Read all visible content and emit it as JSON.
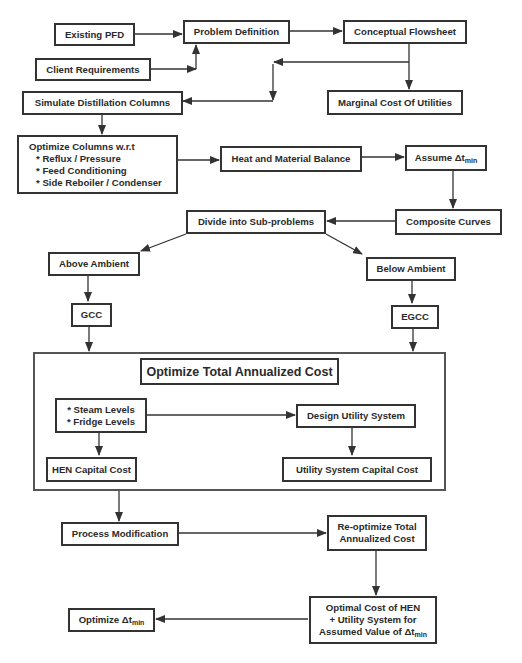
{
  "nodes": {
    "existing_pfd": "Existing PFD",
    "client_requirements": "Client Requirements",
    "problem_definition": "Problem Definition",
    "conceptual_flowsheet": "Conceptual Flowsheet",
    "simulate_distillation": "Simulate Distillation Columns",
    "marginal_cost": "Marginal Cost Of Utilities",
    "optimize_columns": {
      "title": "Optimize Columns w.r.t",
      "items": [
        "* Reflux / Pressure",
        "* Feed Conditioning",
        "* Side Reboiler / Condenser"
      ]
    },
    "heat_material_balance": "Heat and Material Balance",
    "assume_dt": {
      "prefix": "Assume ",
      "symbol": "Δt",
      "subscript": "min"
    },
    "divide_subproblems": "Divide into Sub-problems",
    "composite_curves": "Composite Curves",
    "above_ambient": "Above Ambient",
    "below_ambient": "Below Ambient",
    "gcc": "GCC",
    "egcc": "EGCC",
    "optimize_total": "Optimize Total Annualized Cost",
    "levels": [
      "* Steam Levels",
      "* Fridge Levels"
    ],
    "design_utility": "Design Utility System",
    "hen_capital": "HEN Capital Cost",
    "utility_capital": "Utility System Capital Cost",
    "process_modification": "Process Modification",
    "reoptimize": [
      "Re-optimize Total",
      "Annualized Cost"
    ],
    "optimal_cost": {
      "line1": "Optimal Cost of HEN",
      "line2": "+ Utility System for",
      "line3_prefix": "Assumed Value of ",
      "symbol": "Δt",
      "subscript": "min"
    },
    "optimize_dt": {
      "prefix": "Optimize ",
      "symbol": "Δt",
      "subscript": "min"
    }
  },
  "colors": {
    "line": "#333333",
    "background": "#ffffff"
  }
}
